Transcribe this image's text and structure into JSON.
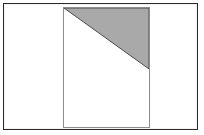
{
  "figure": {
    "caption": "",
    "canvas": {
      "width": 204,
      "height": 135,
      "background_color": "#ffffff"
    },
    "outer_frame": {
      "name": "figure-border",
      "x": 3,
      "y": 3,
      "width": 195,
      "height": 127,
      "border_color": "#2b2b2b",
      "border_width": 1,
      "fill_color": "#ffffff"
    },
    "inner_rectangle": {
      "name": "sheet-rectangle",
      "x": 59,
      "y": 3,
      "width": 87,
      "height": 121,
      "border_color": "#8d8d8d",
      "border_width": 1,
      "fill_color": "#ffffff"
    },
    "shaded_region": {
      "name": "shaded-right-triangle",
      "shape": "triangle",
      "fill_color": "#a9a9a9",
      "edge_color": "#4a4a4a",
      "points": "0,0 87,0 87,62",
      "vertices": [
        {
          "label": "top-left",
          "x": 0,
          "y": 0
        },
        {
          "label": "top-right",
          "x": 87,
          "y": 0
        },
        {
          "label": "lower-right",
          "x": 87,
          "y": 62
        }
      ]
    },
    "labels": []
  }
}
